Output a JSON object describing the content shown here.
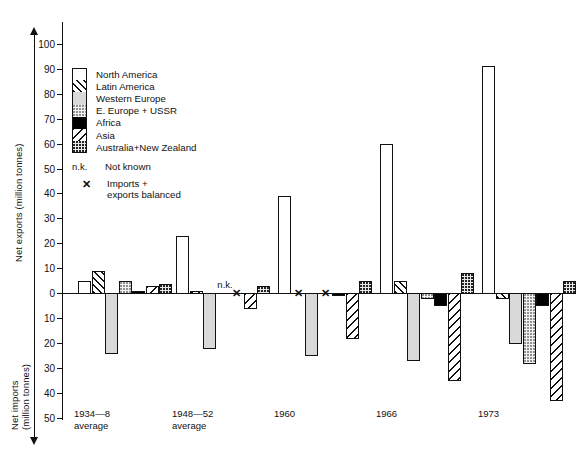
{
  "chart_data": {
    "type": "bar",
    "title": "",
    "xlabel": "",
    "ylabel_positive": "Net exports (million tonnes)",
    "ylabel_negative": "Net imports (million tonnes)",
    "ylim": [
      -50,
      100
    ],
    "y_ticks_positive": [
      100,
      90,
      80,
      70,
      60,
      50,
      40,
      30,
      20,
      10,
      0
    ],
    "y_ticks_negative": [
      10,
      20,
      30,
      40,
      50
    ],
    "grid": false,
    "legend_position": "upper-left inside plot",
    "categories": [
      "1934—8 average",
      "1948—52 average",
      "1960",
      "1966",
      "1973"
    ],
    "series": [
      {
        "name": "North America",
        "key": "north-america",
        "values": [
          5,
          23,
          39,
          60,
          91
        ]
      },
      {
        "name": "Latin America",
        "key": "latin-america",
        "values": [
          9,
          1,
          0,
          5,
          -2
        ]
      },
      {
        "name": "Western Europe",
        "key": "western-europe",
        "values": [
          -24,
          -22,
          -25,
          -27,
          -20
        ]
      },
      {
        "name": "E. Europe + USSR",
        "key": "e-europe-ussr",
        "values": [
          5,
          null,
          0,
          -2,
          -28
        ]
      },
      {
        "name": "Africa",
        "key": "africa",
        "values": [
          1,
          0,
          -1,
          -5,
          -5
        ]
      },
      {
        "name": "Asia",
        "key": "asia",
        "values": [
          3,
          -6,
          -18,
          -35,
          -43
        ]
      },
      {
        "name": "Australia + New Zealand",
        "key": "australia-new-zealand",
        "values": [
          3.5,
          3,
          5,
          8,
          5
        ]
      }
    ],
    "annotations": [
      {
        "type": "not-known",
        "label": "n.k.",
        "category": "1948—52 average",
        "series": "E. Europe + USSR"
      },
      {
        "type": "balanced",
        "label": "✕",
        "category": "1948—52 average",
        "series": "Africa"
      },
      {
        "type": "balanced",
        "label": "✕",
        "category": "1960",
        "series": "Latin America"
      },
      {
        "type": "balanced",
        "label": "✕",
        "category": "1960",
        "series": "E. Europe + USSR"
      }
    ]
  },
  "axis": {
    "positive_label": "Net exports (million tonnes)",
    "negative_label_line1": "Net imports",
    "negative_label_line2": "(million tonnes)",
    "ticks": [
      {
        "label": "100",
        "value": 100
      },
      {
        "label": "90",
        "value": 90
      },
      {
        "label": "80",
        "value": 80
      },
      {
        "label": "70",
        "value": 70
      },
      {
        "label": "60",
        "value": 60
      },
      {
        "label": "50",
        "value": 50
      },
      {
        "label": "40",
        "value": 40
      },
      {
        "label": "30",
        "value": 30
      },
      {
        "label": "20",
        "value": 20
      },
      {
        "label": "10",
        "value": 10
      },
      {
        "label": "0",
        "value": 0
      },
      {
        "label": "10",
        "value": -10
      },
      {
        "label": "20",
        "value": -20
      },
      {
        "label": "30",
        "value": -30
      },
      {
        "label": "40",
        "value": -40
      },
      {
        "label": "50",
        "value": -50
      }
    ]
  },
  "categories": [
    {
      "line1": "1934—8",
      "line2": "average"
    },
    {
      "line1": "1948—52",
      "line2": "average"
    },
    {
      "line1": "1960",
      "line2": ""
    },
    {
      "line1": "1966",
      "line2": ""
    },
    {
      "line1": "1973",
      "line2": ""
    }
  ],
  "legend": {
    "items": [
      {
        "label": "North America",
        "key": "north-america"
      },
      {
        "label": "Latin America",
        "key": "latin-america"
      },
      {
        "label": "Western  Europe",
        "key": "western-europe"
      },
      {
        "label": "E. Europe + USSR",
        "key": "e-europe-ussr"
      },
      {
        "label": "Africa",
        "key": "africa"
      },
      {
        "label": "Asia",
        "key": "asia"
      },
      {
        "label": "Australia+New Zealand",
        "key": "australia-new-zealand"
      }
    ],
    "notes": [
      {
        "key": "n.k.",
        "text_line1": "Not known",
        "text_line2": ""
      },
      {
        "key": "✕",
        "text_line1": "Imports +",
        "text_line2": "exports balanced"
      }
    ]
  },
  "colors": {
    "ink": "#111111",
    "background": "#ffffff",
    "western_europe_fill": "#d9d9d9",
    "africa_fill": "#000000"
  }
}
